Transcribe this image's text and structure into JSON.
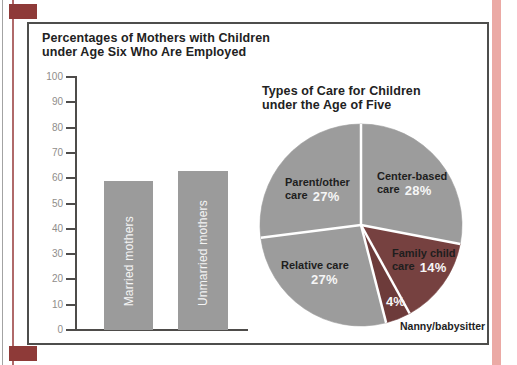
{
  "figure": {
    "bar_title_line1": "Percentages of Mothers with Children",
    "bar_title_line2": "under Age Six Who Are Employed",
    "pie_title_line1": "Types of Care for Children",
    "pie_title_line2": "under the Age of Five"
  },
  "chart_data": [
    {
      "type": "bar",
      "title": "Percentages of Mothers with Children under Age Six Who Are Employed",
      "categories": [
        "Married mothers",
        "Unmarried mothers"
      ],
      "values": [
        59,
        63
      ],
      "xlabel": "",
      "ylabel": "",
      "ylim": [
        0,
        100
      ],
      "yticks": [
        0,
        10,
        20,
        30,
        40,
        50,
        60,
        70,
        80,
        90,
        100
      ],
      "grid": false,
      "legend": "none",
      "bar_color": "#9b9b9b",
      "bar_label_color": "#f4f4f4",
      "axis_color": "#4e4c4a",
      "tick_label_color": "#8f8d8a"
    },
    {
      "type": "pie",
      "title": "Types of Care for Children under the Age of Five",
      "start_angle": "12 o'clock, clockwise",
      "slices": [
        {
          "label": "Center-based care",
          "value_pct": 28,
          "color": "#9c9c9c",
          "line1": "Center-based",
          "line2": "care",
          "pct_label": "28%"
        },
        {
          "label": "Family child care",
          "value_pct": 14,
          "color": "#764140",
          "line1": "Family child",
          "line2": "care",
          "pct_label": "14%"
        },
        {
          "label": "Nanny/babysitter",
          "value_pct": 4,
          "color": "#6d3b3a",
          "pct_label": "4%",
          "label_outside": true
        },
        {
          "label": "Relative care",
          "value_pct": 27,
          "color": "#9c9c9c",
          "line1": "Relative care",
          "pct_label": "27%"
        },
        {
          "label": "Parent/other care",
          "value_pct": 27,
          "color": "#9c9c9c",
          "line1": "Parent/other",
          "line2": "care",
          "pct_label": "27%"
        }
      ],
      "slice_name_color": "#1e1e1e",
      "pct_text_color": "#f6f6f6",
      "divider_color": "#ffffff"
    }
  ],
  "decorations": {
    "background": "#ffffff",
    "frame_border_color": "#4e4e4c",
    "corner_mark_color": "#8e3a38",
    "left_edge_outer_line_color": "#a3a3a3",
    "left_edge_inner_line_color": "#b06a6a",
    "right_edge_strip_color": "#ebaaa5"
  }
}
